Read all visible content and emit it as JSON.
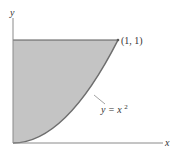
{
  "figure": {
    "x_axis_label": "x",
    "y_axis_label": "y",
    "point_label": "(1, 1)",
    "curve_label_base": "y = x",
    "curve_label_exponent": "2",
    "colors": {
      "fill": "#c4c4c4",
      "curve": "#6e6e6e",
      "axis": "#8a8a8a",
      "boundary": "#5a5a5a",
      "text": "#333333"
    }
  }
}
